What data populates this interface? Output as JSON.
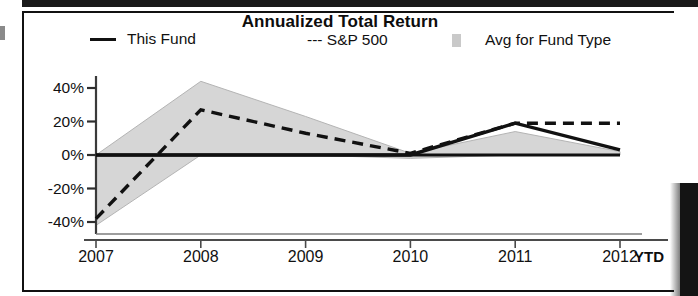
{
  "chart_data": {
    "type": "line",
    "title": "Annualized Total Return",
    "xlabel": "",
    "ylabel": "",
    "categories": [
      "2007",
      "2008",
      "2009",
      "2010",
      "2011",
      "2012"
    ],
    "x_extra_label": "YTD",
    "ytick_labels": [
      "40%",
      "20%",
      "0%",
      "-20%",
      "-40%"
    ],
    "ytick_values": [
      40,
      20,
      0,
      -20,
      -40
    ],
    "ylim": [
      -45,
      48
    ],
    "grid": false,
    "legend_position": "top",
    "series": [
      {
        "name": "This Fund",
        "style": "solid",
        "color": "#111111",
        "values": [
          0,
          0,
          0,
          0,
          19,
          3
        ]
      },
      {
        "name": "S&P 500",
        "style": "dashed",
        "color": "#111111",
        "values": [
          -38,
          27,
          13,
          1,
          19,
          19
        ]
      },
      {
        "name": "Avg for Fund Type",
        "style": "band",
        "color": "#d6d6d6",
        "band_upper": [
          0,
          44,
          23,
          1,
          14,
          2
        ],
        "band_lower": [
          -42,
          0,
          0,
          -2,
          0,
          0
        ]
      }
    ]
  },
  "legend": {
    "this_fund": "This Fund",
    "sp500": "--- S&P 500",
    "avg_fund_type": "Avg for Fund Type"
  },
  "colors": {
    "line": "#111111",
    "band": "#d6d6d6",
    "frame": "#111111",
    "text": "#111111"
  }
}
